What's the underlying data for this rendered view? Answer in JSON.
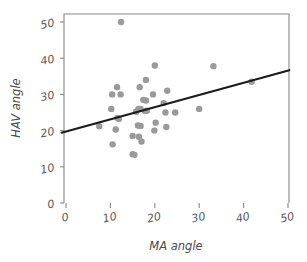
{
  "chart_data": {
    "type": "scatter",
    "title": "",
    "subtitle": "",
    "xlabel": "MA angle",
    "ylabel": "HAV angle",
    "xlim": [
      -1.2,
      50.5
    ],
    "ylim": [
      -1.0,
      51.5
    ],
    "xticks": [
      0,
      10,
      20,
      30,
      40,
      50
    ],
    "yticks": [
      0,
      10,
      20,
      30,
      40,
      50
    ],
    "xtick_labels": [
      "0",
      "10",
      "20",
      "30",
      "40",
      "50"
    ],
    "ytick_labels": [
      "0",
      "10",
      "20",
      "30",
      "40",
      "50"
    ],
    "grid": false,
    "legend": false,
    "legend_position": "none",
    "point_color": "#9a9a9a",
    "point_size": 3.2,
    "line_color": "#1a1a1a",
    "axis_color": "#888888",
    "text_color": "#5a5a5a",
    "background_color": "#ffffff",
    "series": [
      {
        "name": "HAV vs MA",
        "type": "scatter",
        "points": [
          [
            12.4,
            50.0
          ],
          [
            20.0,
            38.0
          ],
          [
            33.2,
            37.8
          ],
          [
            18.0,
            34.0
          ],
          [
            11.5,
            32.0
          ],
          [
            16.6,
            32.0
          ],
          [
            22.8,
            31.0
          ],
          [
            10.4,
            30.0
          ],
          [
            12.3,
            30.0
          ],
          [
            19.6,
            30.0
          ],
          [
            17.4,
            28.5
          ],
          [
            18.0,
            28.3
          ],
          [
            22.0,
            27.6
          ],
          [
            10.2,
            26.0
          ],
          [
            16.3,
            26.0
          ],
          [
            16.8,
            26.0
          ],
          [
            41.8,
            33.5
          ],
          [
            15.8,
            25.2
          ],
          [
            18.2,
            25.5
          ],
          [
            17.8,
            25.4
          ],
          [
            22.4,
            25.0
          ],
          [
            24.6,
            25.0
          ],
          [
            30.0,
            26.0
          ],
          [
            11.6,
            23.5
          ],
          [
            11.9,
            23.2
          ],
          [
            20.2,
            22.2
          ],
          [
            7.5,
            21.2
          ],
          [
            16.2,
            21.4
          ],
          [
            16.8,
            21.3
          ],
          [
            11.2,
            20.3
          ],
          [
            19.9,
            20.0
          ],
          [
            22.6,
            21.0
          ],
          [
            15.0,
            18.5
          ],
          [
            16.4,
            18.3
          ],
          [
            17.0,
            17.0
          ],
          [
            10.5,
            16.2
          ],
          [
            15.0,
            13.5
          ],
          [
            15.4,
            13.3
          ]
        ]
      },
      {
        "name": "regression line",
        "type": "line",
        "points": [
          [
            -1.0,
            19.4
          ],
          [
            50.3,
            36.7
          ]
        ],
        "slope": 0.337,
        "intercept": 19.74
      }
    ],
    "n_points": 38,
    "annotations": []
  },
  "figure": {
    "name": "scatter-plot-hav-ma"
  }
}
